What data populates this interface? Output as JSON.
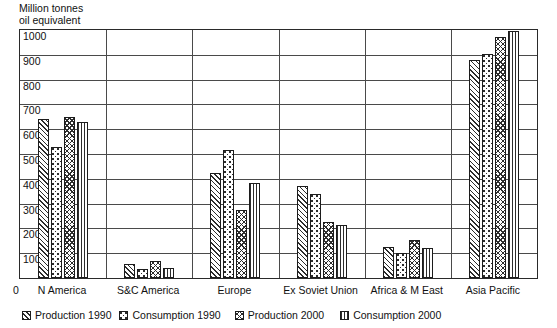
{
  "chart_data": {
    "type": "bar",
    "title": "",
    "subtitle": "",
    "ylabel": "Million tonnes\noil equivalent",
    "xlabel": "",
    "ylim": [
      0,
      1000
    ],
    "yticks": [
      100,
      200,
      300,
      400,
      500,
      600,
      700,
      800,
      900,
      1000
    ],
    "origin_label": "0",
    "grid": true,
    "legend_position": "bottom",
    "categories": [
      "N America",
      "S&C America",
      "Europe",
      "Ex Soviet Union",
      "Africa & M East",
      "Asia Pacific"
    ],
    "series": [
      {
        "name": "Production 1990",
        "pattern": "diagonal-hatch",
        "values": [
          640,
          55,
          425,
          370,
          125,
          880
        ]
      },
      {
        "name": "Consumption 1990",
        "pattern": "dotted",
        "values": [
          530,
          35,
          515,
          340,
          100,
          905
        ]
      },
      {
        "name": "Production 2000",
        "pattern": "cross-hatch",
        "values": [
          650,
          70,
          275,
          225,
          155,
          970
        ]
      },
      {
        "name": "Consumption 2000",
        "pattern": "vertical-lines",
        "values": [
          630,
          40,
          385,
          215,
          120,
          995
        ]
      }
    ],
    "colors": {
      "ink": "#2c2c2c",
      "frame": "#2a2a2a",
      "gridline": "#4a4a4a",
      "background": "#ffffff"
    }
  }
}
